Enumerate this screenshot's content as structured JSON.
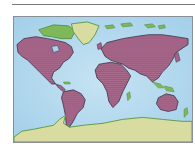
{
  "map": {
    "title": "",
    "projection": "world-map",
    "colors": {
      "ocean": "#a9d3ec",
      "ocean_light": "#c6e3f3",
      "highlighted_land": "#9b5a7e",
      "highlighted_land_texture": "#b07394",
      "other_land": "#d9dca0",
      "coast_green": "#5e9e4a",
      "frame_border": "#8a8f96",
      "rule": "#7a7a7a"
    },
    "regions": [
      {
        "name": "North America",
        "status": "highlighted"
      },
      {
        "name": "South America",
        "status": "highlighted"
      },
      {
        "name": "Europe",
        "status": "highlighted"
      },
      {
        "name": "Asia",
        "status": "highlighted"
      },
      {
        "name": "Africa",
        "status": "highlighted"
      },
      {
        "name": "Australia",
        "status": "highlighted"
      },
      {
        "name": "Greenland",
        "status": "other"
      },
      {
        "name": "Antarctica",
        "status": "other"
      }
    ]
  }
}
